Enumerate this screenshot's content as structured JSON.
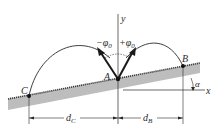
{
  "diagram": {
    "type": "projectile-on-incline",
    "labels": {
      "y_axis": "y",
      "x_axis": "x",
      "point_a": "A",
      "point_b": "B",
      "point_c": "C",
      "angle": "α",
      "minus_phi": "−φ",
      "plus_phi": "+φ",
      "phi_sub": "0",
      "d_c": "d",
      "d_c_sub": "C",
      "d_b": "d",
      "d_b_sub": "B"
    },
    "colors": {
      "ground_fill": "#bdbdbd",
      "ground_edge": "#3a3a3a",
      "line": "#2a2a2a",
      "background": "#ffffff"
    }
  }
}
